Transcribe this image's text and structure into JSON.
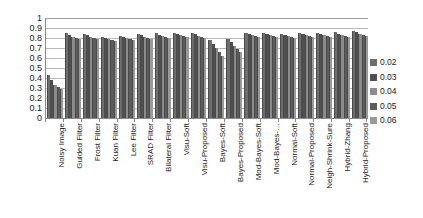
{
  "chart_data": {
    "type": "bar",
    "title": "",
    "subtitle": "",
    "xlabel": "",
    "ylabel": "",
    "ylim": [
      0,
      1
    ],
    "ytick_labels": [
      "1",
      "0.9",
      "0.8",
      "0.7",
      "0.6",
      "0.5",
      "0.4",
      "0.3",
      "0.2",
      "0.1",
      "0"
    ],
    "ytick_values": [
      1,
      0.9,
      0.8,
      0.7,
      0.6,
      0.5,
      0.4,
      0.3,
      0.2,
      0.1,
      0
    ],
    "grid": true,
    "grid_axis": "y",
    "legend_position": "right",
    "legend_title": "",
    "categories": [
      "Noisy Image",
      "Guided Filter",
      "Frost Filter",
      "Kuan Filter",
      "Lee Filter",
      "SRAD Filter",
      "Bilateral Filter",
      "Visu-Soft",
      "Visu-Proposed",
      "Bayes-Soft",
      "Bayes-Proposed",
      "Mod-Bayes-Soft",
      "Mod-Bayes-…",
      "Normal-Soft",
      "Normal-Proposed",
      "Neigh-Shrink-Sure",
      "Hybrid-Zhang",
      "Hybrid-Proposed"
    ],
    "series": [
      {
        "name": "0.02",
        "color": "#6e6e6e",
        "values": [
          0.43,
          0.85,
          0.84,
          0.81,
          0.82,
          0.84,
          0.85,
          0.85,
          0.85,
          0.78,
          0.79,
          0.85,
          0.85,
          0.84,
          0.85,
          0.85,
          0.86,
          0.87
        ]
      },
      {
        "name": "0.03",
        "color": "#4f4f4f",
        "values": [
          0.38,
          0.83,
          0.83,
          0.8,
          0.81,
          0.83,
          0.83,
          0.84,
          0.84,
          0.74,
          0.76,
          0.84,
          0.84,
          0.83,
          0.84,
          0.84,
          0.84,
          0.86
        ]
      },
      {
        "name": "0.04",
        "color": "#8c8c8c",
        "values": [
          0.33,
          0.81,
          0.81,
          0.79,
          0.8,
          0.81,
          0.82,
          0.83,
          0.82,
          0.7,
          0.72,
          0.83,
          0.83,
          0.82,
          0.83,
          0.83,
          0.83,
          0.84
        ]
      },
      {
        "name": "0.05",
        "color": "#5c5c5c",
        "values": [
          0.31,
          0.8,
          0.8,
          0.78,
          0.79,
          0.8,
          0.81,
          0.82,
          0.81,
          0.66,
          0.69,
          0.82,
          0.82,
          0.81,
          0.82,
          0.82,
          0.82,
          0.83
        ]
      },
      {
        "name": "0.06",
        "color": "#9a9a9a",
        "values": [
          0.29,
          0.79,
          0.79,
          0.77,
          0.78,
          0.79,
          0.8,
          0.81,
          0.8,
          0.62,
          0.66,
          0.81,
          0.81,
          0.8,
          0.81,
          0.81,
          0.81,
          0.82
        ]
      }
    ]
  },
  "legend": {
    "items": [
      {
        "label": "0.02"
      },
      {
        "label": "0.03"
      },
      {
        "label": "0.04"
      },
      {
        "label": "0.05"
      },
      {
        "label": "0.06"
      }
    ]
  }
}
